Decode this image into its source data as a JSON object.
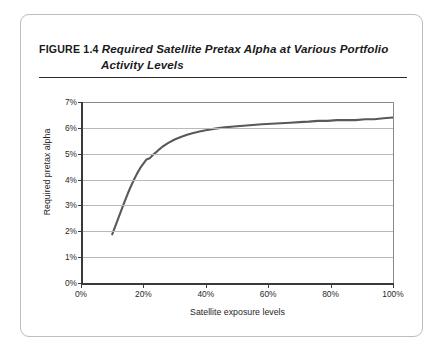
{
  "figure": {
    "label": "FIGURE 1.4",
    "title_line1": "Required Satellite Pretax Alpha at Various Portfolio",
    "title_line2": "Activity Levels"
  },
  "chart_data": {
    "type": "line",
    "title": "Required Satellite Pretax Alpha at Various Portfolio Activity Levels",
    "xlabel": "Satellite exposure levels",
    "ylabel": "Required pretax alpha",
    "xlim": [
      0,
      100
    ],
    "ylim": [
      0,
      7
    ],
    "grid": true,
    "legend": "none",
    "x_tick_labels": [
      "0%",
      "20%",
      "40%",
      "60%",
      "80%",
      "100%"
    ],
    "x_tick_values": [
      0,
      20,
      40,
      60,
      80,
      100
    ],
    "y_tick_labels": [
      "0%",
      "1%",
      "2%",
      "3%",
      "4%",
      "5%",
      "6%",
      "7%"
    ],
    "y_tick_values": [
      0,
      1,
      2,
      3,
      4,
      5,
      6,
      7
    ],
    "series": [
      {
        "name": "Required pretax alpha",
        "color": "#595959",
        "x": [
          10,
          11,
          12,
          13,
          14,
          15,
          16,
          17,
          18,
          19,
          20,
          21,
          22,
          23,
          24,
          25,
          26,
          28,
          30,
          32,
          34,
          36,
          38,
          40,
          43,
          46,
          49,
          52,
          55,
          58,
          61,
          64,
          67,
          70,
          73,
          76,
          79,
          82,
          85,
          88,
          91,
          94,
          97,
          100
        ],
        "y": [
          1.88,
          2.2,
          2.52,
          2.84,
          3.16,
          3.46,
          3.74,
          4.0,
          4.24,
          4.45,
          4.62,
          4.78,
          4.82,
          4.95,
          5.05,
          5.16,
          5.26,
          5.42,
          5.55,
          5.65,
          5.73,
          5.8,
          5.86,
          5.91,
          5.97,
          6.02,
          6.05,
          6.08,
          6.11,
          6.14,
          6.16,
          6.18,
          6.2,
          6.22,
          6.24,
          6.27,
          6.27,
          6.3,
          6.3,
          6.3,
          6.33,
          6.33,
          6.37,
          6.4
        ]
      }
    ]
  }
}
